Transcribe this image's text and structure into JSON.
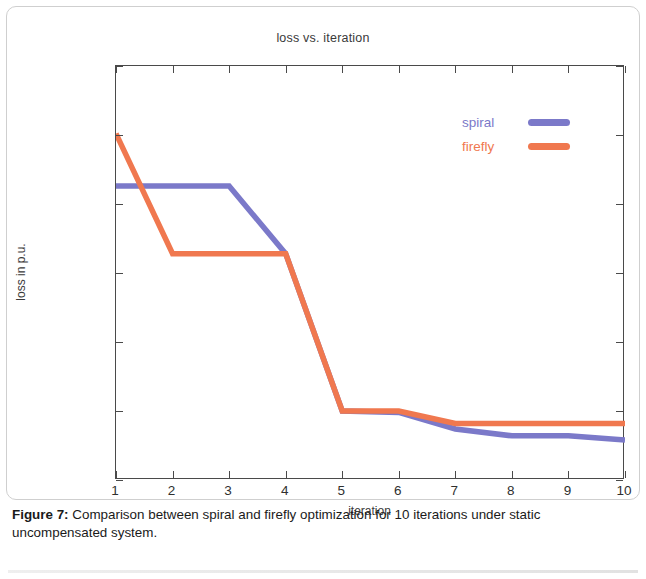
{
  "figure": {
    "caption_label": "Figure 7:",
    "caption_text": " Comparison between spiral and firefly optimization for 10 iterations under static uncompensated system."
  },
  "legend": {
    "position": "top-right",
    "entries": [
      {
        "label": "spiral",
        "color": "#7b79c9"
      },
      {
        "label": "firefly",
        "color": "#f0784f"
      }
    ]
  },
  "chart_data": {
    "type": "line",
    "title": "loss vs. iteration",
    "xlabel": "iteration",
    "ylabel": "loss in p.u.",
    "grid": false,
    "legend_position": "top-right",
    "x": [
      1,
      2,
      3,
      4,
      5,
      6,
      7,
      8,
      9,
      10
    ],
    "xtick_labels": [
      "1",
      "2",
      "3",
      "4",
      "5",
      "6",
      "7",
      "8",
      "9",
      "10"
    ],
    "xlim": [
      1,
      10
    ],
    "ylim": [
      0.0541,
      0.0544
    ],
    "ytick_values": [
      0.0544,
      0.05435,
      0.0543,
      0.05425,
      0.0542,
      0.05415,
      0.0541
    ],
    "ytick_labels": [
      "0.0544",
      "0.0543",
      "0.0543",
      "0.0542",
      "0.0542",
      "0.0541",
      "0.0541"
    ],
    "series": [
      {
        "name": "spiral",
        "color": "#7b79c9",
        "values": [
          0.054313,
          0.054313,
          0.054313,
          0.054264,
          0.05415,
          0.054149,
          0.054137,
          0.054132,
          0.054132,
          0.054129
        ]
      },
      {
        "name": "firefly",
        "color": "#f0784f",
        "values": [
          0.054351,
          0.054264,
          0.054264,
          0.054264,
          0.05415,
          0.05415,
          0.054141,
          0.054141,
          0.054141,
          0.054141
        ]
      }
    ]
  }
}
